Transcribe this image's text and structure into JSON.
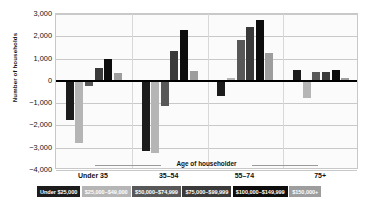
{
  "chart_data": {
    "type": "bar",
    "title": "",
    "xlabel": "Age of householder",
    "ylabel": "Number of households",
    "categories": [
      "Under 35",
      "35–54",
      "55–74",
      "75+"
    ],
    "ylim": [
      -4000,
      3000
    ],
    "yticks": [
      3000,
      2000,
      1000,
      0,
      -1000,
      -2000,
      -3000,
      -4000
    ],
    "ytick_labels": [
      "3,000",
      "2,000",
      "1,000",
      "0",
      "−1,000",
      "−2,000",
      "−3,000",
      "−4,000"
    ],
    "grid": true,
    "legend_position": "bottom",
    "series": [
      {
        "name": "Under $25,000",
        "color": "#1c1c1c",
        "text_color": "#ffffff",
        "values": [
          -1750,
          -3150,
          -700,
          500
        ]
      },
      {
        "name": "$25,000–$49,000",
        "color": "#b5b5b5",
        "text_color": "#ffffff",
        "values": [
          -2800,
          -3250,
          150,
          -750
        ]
      },
      {
        "name": "$50,000–$74,999",
        "color": "#585858",
        "text_color": "#ffffff",
        "values": [
          -250,
          -1150,
          1850,
          400
        ]
      },
      {
        "name": "$75,000–$99,999",
        "color": "#3a3a3a",
        "text_color": "#ffffff",
        "values": [
          570,
          1350,
          2400,
          400
        ]
      },
      {
        "name": "$100,000–$149,999",
        "color": "#0d0d0d",
        "text_color": "#ffffff",
        "values": [
          1000,
          2300,
          2750,
          500
        ]
      },
      {
        "name": "$150,000+",
        "color": "#9d9d9d",
        "text_color": "#ffffff",
        "values": [
          350,
          450,
          1250,
          120
        ]
      }
    ]
  }
}
